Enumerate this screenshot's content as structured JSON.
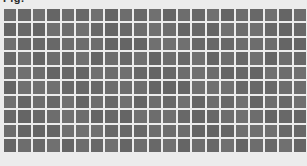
{
  "page": {
    "title": "Fig.",
    "background_color": "#ececec"
  },
  "grid": {
    "rows": 10,
    "columns": 22,
    "cell_color": "#6b6b6b",
    "gap_color": "#ececec",
    "cell_width_px": 12.3,
    "cell_height_px": 12.3,
    "gap_px": 2.2,
    "origin_x_px": 4,
    "origin_y_px": 9
  },
  "chart_data": {
    "type": "heatmap",
    "title": "Fig.",
    "xlabel": "",
    "ylabel": "",
    "grid": true,
    "legend": "none",
    "columns": 22,
    "rows": 10,
    "values": [
      [
        1,
        1,
        1,
        1,
        1,
        1,
        1,
        1,
        1,
        1,
        1,
        1,
        1,
        1,
        1,
        1,
        1,
        1,
        1,
        1,
        1,
        1
      ],
      [
        1,
        1,
        1,
        1,
        1,
        1,
        1,
        1,
        1,
        1,
        1,
        1,
        1,
        1,
        1,
        1,
        1,
        1,
        1,
        1,
        1,
        1
      ],
      [
        1,
        1,
        1,
        1,
        1,
        1,
        1,
        1,
        1,
        1,
        1,
        1,
        1,
        1,
        1,
        1,
        1,
        1,
        1,
        1,
        1,
        1
      ],
      [
        1,
        1,
        1,
        1,
        1,
        1,
        1,
        1,
        1,
        1,
        1,
        1,
        1,
        1,
        1,
        1,
        1,
        1,
        1,
        1,
        1,
        1
      ],
      [
        1,
        1,
        1,
        1,
        1,
        1,
        1,
        1,
        1,
        1,
        1,
        1,
        1,
        1,
        1,
        1,
        1,
        1,
        1,
        1,
        1,
        1
      ],
      [
        1,
        1,
        1,
        1,
        1,
        1,
        1,
        1,
        1,
        1,
        1,
        1,
        1,
        1,
        1,
        1,
        1,
        1,
        1,
        1,
        1,
        1
      ],
      [
        1,
        1,
        1,
        1,
        1,
        1,
        1,
        1,
        1,
        1,
        1,
        1,
        1,
        1,
        1,
        1,
        1,
        1,
        1,
        1,
        1,
        1
      ],
      [
        1,
        1,
        1,
        1,
        1,
        1,
        1,
        1,
        1,
        1,
        1,
        1,
        1,
        1,
        1,
        1,
        1,
        1,
        1,
        1,
        1,
        1
      ],
      [
        1,
        1,
        1,
        1,
        1,
        1,
        1,
        1,
        1,
        1,
        1,
        1,
        1,
        1,
        1,
        1,
        1,
        1,
        1,
        1,
        1,
        1
      ],
      [
        1,
        1,
        1,
        1,
        1,
        1,
        1,
        1,
        1,
        1,
        1,
        1,
        1,
        1,
        1,
        1,
        1,
        1,
        1,
        1,
        1,
        1
      ]
    ]
  }
}
